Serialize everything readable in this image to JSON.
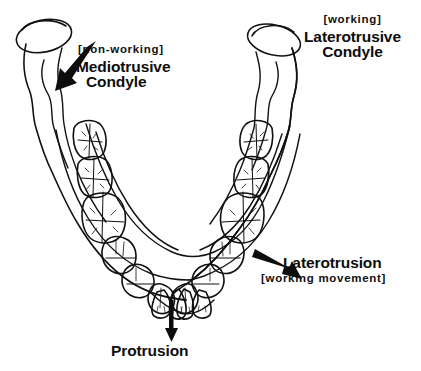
{
  "figure": {
    "background_color": "#ffffff",
    "ink_color": "#111111"
  },
  "labels": {
    "mediotrusive": {
      "bracket": "[non-working]",
      "line1": "Mediotrusive",
      "line2": "Condyle"
    },
    "laterotrusive": {
      "bracket": "[working]",
      "line1": "Laterotrusive",
      "line2": "Condyle"
    },
    "laterotrusion": {
      "line1": "Laterotrusion",
      "line2": "[working movement]"
    },
    "protrusion": {
      "line1": "Protrusion"
    }
  },
  "arrows": [
    {
      "name": "mediotrusive-arrow",
      "direction": "down-left",
      "points_to": "left-condyle-neck"
    },
    {
      "name": "laterotrusion-arrow",
      "direction": "down-right",
      "points_to": "right-posterior-teeth"
    },
    {
      "name": "protrusion-arrow",
      "direction": "down",
      "points_to": "anterior-incisors"
    }
  ],
  "anatomy": {
    "condyles": [
      {
        "name": "left-condyle",
        "side": "left",
        "role": "non-working"
      },
      {
        "name": "right-condyle",
        "side": "right",
        "role": "working"
      }
    ],
    "teeth_per_side": {
      "molars": 3,
      "premolars": 2,
      "canine": 1
    },
    "incisors": 4
  }
}
